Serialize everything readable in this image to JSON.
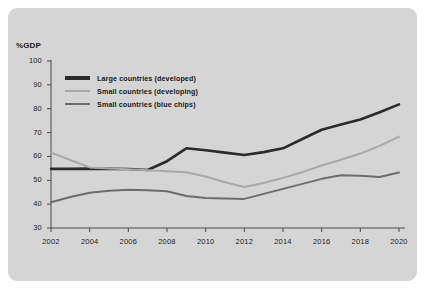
{
  "panel": {
    "background_color": "#d5d5d5",
    "page_background": "#ffffff"
  },
  "chart_data": {
    "type": "line",
    "title": "",
    "subtitle": "",
    "xlabel": "",
    "ylabel": "%GDP",
    "grid": false,
    "legend_position": "top-left inside plot",
    "xlim": [
      2002,
      2020
    ],
    "ylim": [
      30,
      100
    ],
    "x_ticks": [
      "2002",
      "2004",
      "2006",
      "2008",
      "2010",
      "2012",
      "2014",
      "2016",
      "2018",
      "2020"
    ],
    "y_ticks": [
      "100",
      "90",
      "80",
      "70",
      "60",
      "50",
      "40",
      "30"
    ],
    "x": [
      2002,
      2003,
      2004,
      2005,
      2006,
      2007,
      2008,
      2009,
      2010,
      2011,
      2012,
      2013,
      2014,
      2015,
      2016,
      2017,
      2018,
      2019,
      2020
    ],
    "series": [
      {
        "name": "Large countries  (developed)",
        "color": "#2b2b2b",
        "width": 2.6,
        "values": [
          54.8,
          54.8,
          54.9,
          54.8,
          54.7,
          54.3,
          58.0,
          63.4,
          62.6,
          61.6,
          60.6,
          61.8,
          63.4,
          67.3,
          71.2,
          73.4,
          75.5,
          78.5,
          81.8
        ]
      },
      {
        "name": "Small countries (developing)",
        "color": "#a9a9a9",
        "width": 2.0,
        "values": [
          61.6,
          58.5,
          55.4,
          54.9,
          54.6,
          54.2,
          53.8,
          53.4,
          51.6,
          49.2,
          47.2,
          48.9,
          51.0,
          53.4,
          56.2,
          58.6,
          61.2,
          64.4,
          68.3
        ]
      },
      {
        "name": "Small countries (blue chips)",
        "color": "#6d6d6d",
        "width": 2.0,
        "values": [
          40.8,
          43.0,
          44.8,
          45.6,
          46.0,
          45.8,
          45.4,
          43.4,
          42.6,
          42.4,
          42.2,
          44.3,
          46.4,
          48.5,
          50.6,
          52.1,
          51.9,
          51.4,
          53.3
        ]
      }
    ]
  },
  "legend": {
    "items": [
      {
        "label": "Large countries  (developed)",
        "color": "#2b2b2b"
      },
      {
        "label": "Small countries (developing)",
        "color": "#a9a9a9"
      },
      {
        "label": "Small countries (blue chips)",
        "color": "#6d6d6d"
      }
    ]
  },
  "axis": {
    "y_title": "%GDP",
    "axis_color": "#4a4a4a"
  }
}
